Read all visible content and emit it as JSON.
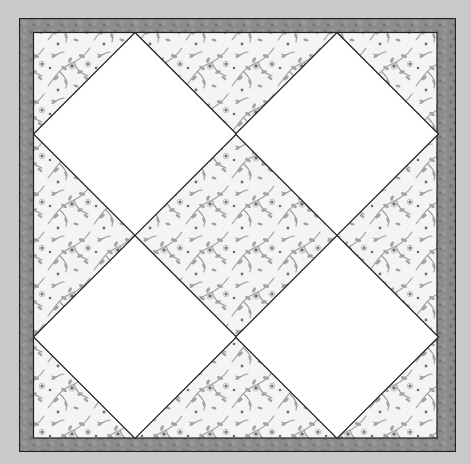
{
  "image": {
    "description": "Quilt block: four white diamond (on-point square) patches set on a grey floral print background, framed by a mottled grey border",
    "background_color": "#c9c9c9"
  },
  "quilt_block": {
    "border": {
      "fabric": "mottled-grey",
      "color": "#8c8c8c",
      "color_dark": "#6f6f6f",
      "outline_color": "#222222"
    },
    "field": {
      "fabric": "grey-floral-print",
      "base_color": "#f4f4f4",
      "print_color": "#9a9a9a",
      "print_dark": "#6e6e6e"
    },
    "diamonds": [
      {
        "id": "top-left",
        "cx": 135,
        "cy": 134,
        "color": "#ffffff"
      },
      {
        "id": "top-right",
        "cx": 337,
        "cy": 134,
        "color": "#ffffff"
      },
      {
        "id": "bottom-left",
        "cx": 135,
        "cy": 337,
        "color": "#ffffff"
      },
      {
        "id": "bottom-right",
        "cx": 337,
        "cy": 337,
        "color": "#ffffff"
      }
    ],
    "grid": {
      "rows": 2,
      "cols": 2,
      "layout": "on-point"
    }
  }
}
